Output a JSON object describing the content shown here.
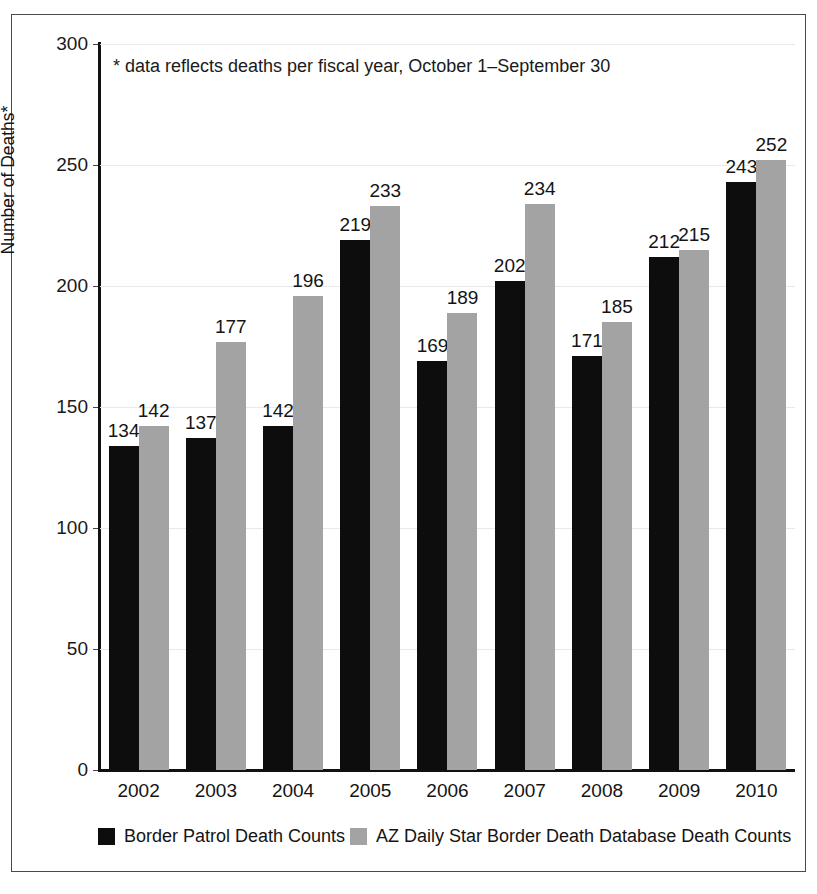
{
  "chart_data": {
    "type": "bar",
    "title": "",
    "subtitle": "",
    "xlabel": "",
    "ylabel": "Number of Deaths*",
    "ylim": [
      0,
      300
    ],
    "yticks": [
      0,
      50,
      100,
      150,
      200,
      250,
      300
    ],
    "ytick_labels": [
      "0",
      "50",
      "100",
      "150",
      "200",
      "250",
      "300"
    ],
    "grid": true,
    "grid_axis": "y",
    "legend_position": "bottom",
    "annotation": "* data reflects deaths per fiscal year, October 1–September 30",
    "categories": [
      "2002",
      "2003",
      "2004",
      "2005",
      "2006",
      "2007",
      "2008",
      "2009",
      "2010"
    ],
    "series": [
      {
        "name": "Border Patrol Death Counts",
        "color": "#0d0d0d",
        "values": [
          134,
          137,
          142,
          219,
          169,
          202,
          171,
          212,
          243
        ]
      },
      {
        "name": "AZ Daily Star Border Death Database Death Counts",
        "color": "#a3a3a3",
        "values": [
          142,
          177,
          196,
          233,
          189,
          234,
          185,
          215,
          252
        ]
      }
    ]
  },
  "legend": {
    "entries": [
      {
        "label": "Border Patrol Death Counts",
        "color": "#0d0d0d"
      },
      {
        "label": "AZ Daily Star Border Death Database Death Counts",
        "color": "#a3a3a3"
      }
    ]
  }
}
